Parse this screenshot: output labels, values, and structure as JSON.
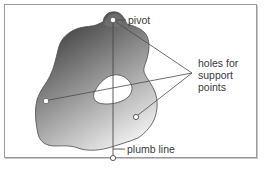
{
  "diagram": {
    "labels": {
      "pivot": "pivot",
      "holes": "holes for support points",
      "holes_lines": [
        "holes for",
        "support",
        "points"
      ],
      "plumb_line": "plumb line"
    },
    "colors": {
      "frame": "#9a9a9a",
      "lamina_dark": "#3c3c3c",
      "lamina_light": "#f2f2f2",
      "lines": "#4a4a4a",
      "text": "#3a3a3a"
    },
    "points": {
      "pivot_hole": [
        113,
        20
      ],
      "left_hole": [
        46,
        101
      ],
      "right_hole": [
        136,
        117
      ],
      "plumb_bob": [
        113,
        158
      ],
      "label_convergence": [
        192,
        73
      ]
    }
  }
}
